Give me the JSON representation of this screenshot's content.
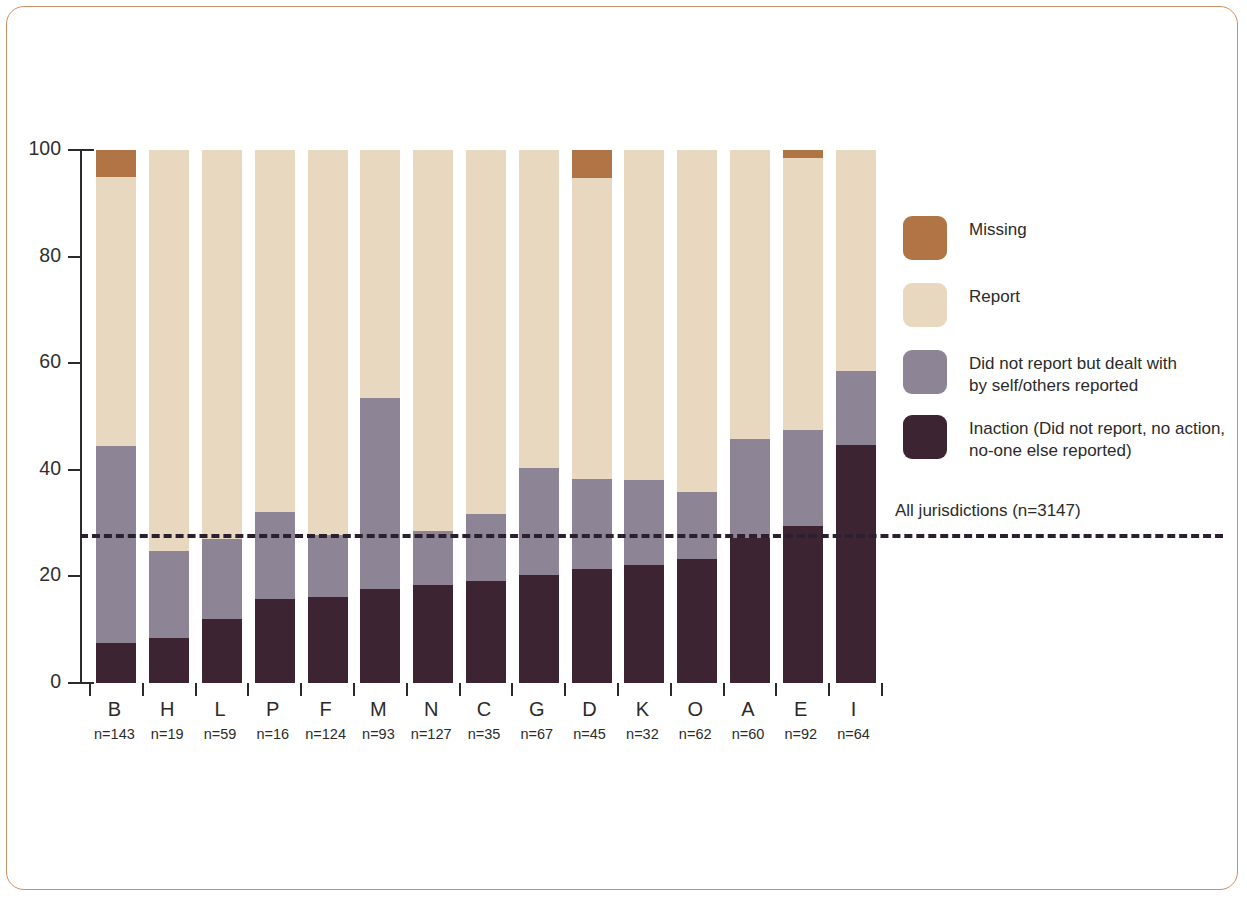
{
  "colors": {
    "missing": "#b07445",
    "report": "#e9d8c0",
    "dealt": "#8d8495",
    "inaction": "#3c2433",
    "frame": "#c98f66",
    "axis": "#2b2b2b"
  },
  "legend": {
    "items": [
      {
        "label": "Missing",
        "color_key": "missing"
      },
      {
        "label": "Report",
        "color_key": "report"
      },
      {
        "label": "Did not report but dealt with\nby self/others reported",
        "color_key": "dealt"
      },
      {
        "label": "Inaction (Did not report, no action,\nno-one else reported)",
        "color_key": "inaction"
      }
    ]
  },
  "reference_line": {
    "label": "All jurisdictions (n=3147)",
    "value": 28
  },
  "axis": {
    "y_ticks": [
      "0",
      "20",
      "40",
      "60",
      "80",
      "100"
    ],
    "y_min": 0,
    "y_max": 100
  },
  "chart_data": {
    "type": "bar",
    "title": "",
    "xlabel": "",
    "ylabel": "",
    "ylim": [
      0,
      100
    ],
    "grid": false,
    "stacked": true,
    "legend_position": "right",
    "categories": [
      "B",
      "H",
      "L",
      "P",
      "F",
      "M",
      "N",
      "C",
      "G",
      "D",
      "K",
      "O",
      "A",
      "E",
      "I"
    ],
    "category_counts": [
      "n=143",
      "n=19",
      "n=59",
      "n=16",
      "n=124",
      "n=93",
      "n=127",
      "n=35",
      "n=67",
      "n=45",
      "n=32",
      "n=62",
      "n=60",
      "n=92",
      "n=64"
    ],
    "series": [
      {
        "name": "Inaction (Did not report, no action, no-one else reported)",
        "color_key": "inaction",
        "values": [
          7.5,
          8.4,
          12.0,
          15.8,
          16.2,
          17.6,
          18.4,
          19.2,
          20.3,
          21.3,
          22.2,
          23.2,
          27.2,
          29.4,
          44.6
        ]
      },
      {
        "name": "Did not report but dealt with by self/others reported",
        "color_key": "dealt",
        "values": [
          37.0,
          16.4,
          15.0,
          16.2,
          11.6,
          35.9,
          10.2,
          12.6,
          20.0,
          16.9,
          15.8,
          12.6,
          18.5,
          18.0,
          13.9
        ]
      },
      {
        "name": "Report",
        "color_key": "report",
        "values": [
          50.5,
          75.2,
          73.0,
          68.0,
          72.2,
          46.5,
          71.4,
          68.2,
          59.7,
          56.5,
          62.0,
          64.2,
          54.3,
          51.1,
          41.5
        ]
      },
      {
        "name": "Missing",
        "color_key": "missing",
        "values": [
          5.0,
          0,
          0,
          0,
          0,
          0,
          0,
          0,
          0,
          5.3,
          0,
          0,
          0,
          1.5,
          0
        ]
      }
    ]
  }
}
